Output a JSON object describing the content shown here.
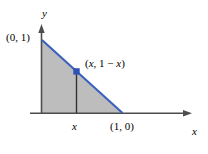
{
  "figure": {
    "name": "triangle-region-diagram",
    "background_color": "#ffffff",
    "axis_color": "#4d4d4d",
    "fill_color": "#bdbdbd",
    "line_color": "#3a5fbd",
    "point_color": "#2d52b8",
    "labels": {
      "y_intercept": "(0, 1)",
      "point": "(x, 1 − x)",
      "point_x": "x",
      "point_rest": ", 1 − ",
      "point_x2": "x",
      "x_tick": "x",
      "x_intercept": "(1, 0)",
      "axis_y": "y",
      "axis_x": "x"
    }
  },
  "chart_data": {
    "type": "area",
    "title": "",
    "xlabel": "x",
    "ylabel": "y",
    "xlim": [
      0,
      1.45
    ],
    "ylim": [
      0,
      1.2
    ],
    "grid": false,
    "legend": null,
    "series": [
      {
        "name": "y = 1 - x",
        "x": [
          0,
          1
        ],
        "values": [
          1,
          0
        ],
        "color": "#3a5fbd",
        "filled": true,
        "fill_color": "#bdbdbd"
      }
    ],
    "annotations": [
      {
        "text": "(0, 1)",
        "x": 0,
        "y": 1,
        "position": "left"
      },
      {
        "text": "(x, 1 − x)",
        "x": 0.48,
        "y": 0.52,
        "position": "right"
      },
      {
        "text": "(1, 0)",
        "x": 1,
        "y": 0,
        "position": "below"
      },
      {
        "text": "x",
        "x": 0.43,
        "y": 0,
        "position": "below"
      }
    ],
    "points": [
      {
        "x": 0.43,
        "y": 0.57,
        "marker": "square",
        "color": "#2d52b8"
      }
    ],
    "vertical_segments": [
      {
        "x": 0.43,
        "y0": 0,
        "y1": 0.57
      }
    ]
  }
}
